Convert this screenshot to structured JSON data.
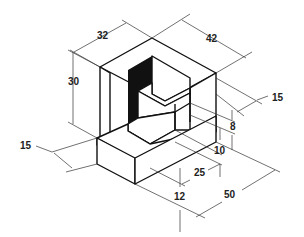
{
  "dimensions": {
    "top_depth": "32",
    "top_width": "42",
    "overall_height": "30",
    "right_step_offset": "15",
    "left_step_offset": "15",
    "upper_step_height": "8",
    "lower_step_height": "10",
    "step_depth": "25",
    "base_height": "12",
    "overall_length": "50"
  },
  "colors": {
    "line": "#111111",
    "background": "#ffffff"
  }
}
